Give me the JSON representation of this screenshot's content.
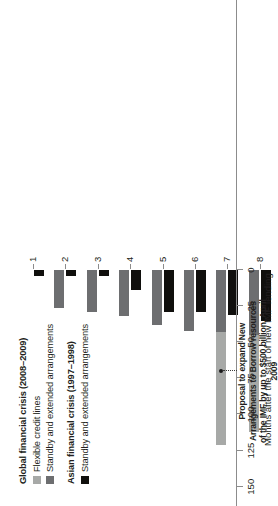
{
  "chart_data": {
    "type": "bar",
    "orientation": "rotated-90ccw-stacked-grouped",
    "title": "",
    "xlabel": "Months after the start of new IMF lending",
    "ylabel": "",
    "categories": [
      "1",
      "2",
      "3",
      "4",
      "5",
      "6",
      "7",
      "8",
      "9",
      "10",
      "11",
      "12",
      "13",
      "14",
      "15"
    ],
    "ylim": [
      0,
      175
    ],
    "yticks": [
      0,
      25,
      50,
      75,
      100,
      125,
      150
    ],
    "ytick_labels": [
      "0",
      "25",
      "50",
      "75",
      "100",
      "125",
      "150"
    ],
    "grid": false,
    "legend_position": "bottom-left",
    "series": [
      {
        "name": "Flexible credit lines",
        "group": "Global financial crisis (2008–2009)",
        "color": "#a7a9a7",
        "values": [
          0,
          0,
          0,
          0,
          0,
          0,
          78,
          67,
          67,
          67,
          67,
          67,
          68,
          82,
          82
        ]
      },
      {
        "name": "Standby and extended arrangements",
        "group": "Global financial crisis (2008–2009)",
        "color": "#6d6e70",
        "values": [
          0,
          26,
          29,
          32,
          38,
          42,
          43,
          45,
          45,
          49,
          52,
          55,
          57,
          57,
          57
        ]
      },
      {
        "name": "Standby and extended arrangements",
        "group": "Asian financial crisis (1997–1998)",
        "color": "#100f0d",
        "values": [
          4,
          4,
          4,
          14,
          29,
          29,
          31,
          35,
          35,
          35,
          35,
          44,
          44,
          40,
          40
        ]
      }
    ],
    "annotations": [
      {
        "text": "Proposal to expand New Arrangements to Borrow resources of the IMF by up to $500 billion, April 2009",
        "points_to_month": "7",
        "points_to_value": 70
      }
    ]
  },
  "legend": {
    "groups": [
      {
        "title": "Global financial crisis (2008–2009)",
        "entries": [
          {
            "label": "Flexible credit lines",
            "color": "#a7a9a7"
          },
          {
            "label": "Standby and extended arrangements",
            "color": "#6d6e70"
          }
        ]
      },
      {
        "title": "Asian financial crisis (1997–1998)",
        "entries": [
          {
            "label": "Standby and extended arrangements",
            "color": "#100f0d"
          }
        ]
      }
    ]
  },
  "annotation": {
    "text": "Proposal to expand New Arrangements to Borrow resources of the IMF by up to $500 billion, April 2009"
  },
  "axis": {
    "x_title": "Months after the start of new IMF lending",
    "y_tick_labels": [
      "150",
      "125",
      "100",
      "75",
      "50",
      "25",
      "0"
    ],
    "x_tick_labels": [
      "15",
      "14",
      "13",
      "12",
      "11",
      "10",
      "9",
      "8",
      "7",
      "6",
      "5",
      "4",
      "3",
      "2",
      "1"
    ]
  }
}
